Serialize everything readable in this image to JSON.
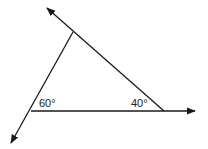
{
  "diagram": {
    "type": "geometry-triangle",
    "angles": [
      {
        "vertex": "bottom-left",
        "label": "60°"
      },
      {
        "vertex": "bottom-right",
        "label": "40°"
      }
    ],
    "vertices": {
      "top": [
        73,
        32
      ],
      "bottom_left": [
        31,
        111
      ],
      "bottom_right": [
        164,
        111
      ]
    },
    "rays": [
      {
        "from": "bottom_right",
        "through": "top",
        "tip": [
          47,
          8
        ]
      },
      {
        "from": "top",
        "through": "bottom_left",
        "tip": [
          11,
          143
        ]
      },
      {
        "from": "bottom_left",
        "through": "bottom_right",
        "tip": [
          195,
          111
        ]
      }
    ],
    "line_color": "#1a1a1a"
  }
}
